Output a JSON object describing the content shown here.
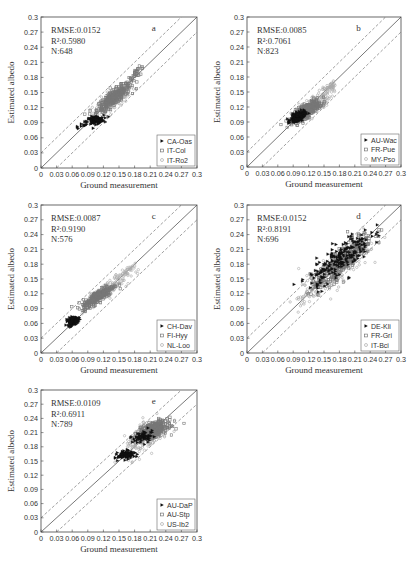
{
  "chart_data": [
    {
      "type": "scatter",
      "panel": "a",
      "xlabel": "Ground measurement",
      "ylabel": "Estimated albedo",
      "xlim": [
        0,
        0.3
      ],
      "ylim": [
        0,
        0.3
      ],
      "xticks": [
        "0",
        "0.03",
        "0.06",
        "0.09",
        "0.12",
        "0.15",
        "0.18",
        "0.21",
        "0.24",
        "0.27",
        "0.3"
      ],
      "yticks": [
        "0",
        "0.03",
        "0.06",
        "0.09",
        "0.12",
        "0.15",
        "0.18",
        "0.21",
        "0.24",
        "0.27",
        "0.3"
      ],
      "stats": {
        "rmse": "RMSE:0.0152",
        "r2": "R²:0.5980",
        "n": "N:648"
      },
      "reference_lines": {
        "one_to_one": true,
        "offset": 0.03
      },
      "legend": [
        "CA-Oas",
        "IT-Col",
        "IT-Ro2"
      ],
      "series": [
        {
          "name": "CA-Oas",
          "marker": "triangle",
          "color": "#111111",
          "clusters": [
            {
              "cx": 0.105,
              "cy": 0.095,
              "sx": 0.008,
              "sy": 0.004,
              "n": 110,
              "rho": 0.3
            },
            {
              "cx": 0.08,
              "cy": 0.085,
              "sx": 0.01,
              "sy": 0.006,
              "n": 12,
              "rho": 0.8
            }
          ]
        },
        {
          "name": "IT-Col",
          "marker": "square",
          "color": "#777777",
          "clusters": [
            {
              "cx": 0.14,
              "cy": 0.14,
              "sx": 0.016,
              "sy": 0.014,
              "n": 330,
              "rho": 0.85
            },
            {
              "cx": 0.185,
              "cy": 0.19,
              "sx": 0.007,
              "sy": 0.006,
              "n": 30,
              "rho": 0.7
            }
          ]
        },
        {
          "name": "IT-Ro2",
          "marker": "circle",
          "color": "#aaaaaa",
          "clusters": [
            {
              "cx": 0.14,
              "cy": 0.135,
              "sx": 0.02,
              "sy": 0.016,
              "n": 150,
              "rho": 0.8
            }
          ]
        }
      ]
    },
    {
      "type": "scatter",
      "panel": "b",
      "xlabel": "Ground measurement",
      "ylabel": "Estimated albedo",
      "xlim": [
        0,
        0.3
      ],
      "ylim": [
        0,
        0.3
      ],
      "xticks": [
        "0",
        "0.03",
        "0.06",
        "0.09",
        "0.12",
        "0.15",
        "0.18",
        "0.21",
        "0.24",
        "0.27",
        "0.3"
      ],
      "yticks": [
        "0",
        "0.03",
        "0.06",
        "0.09",
        "0.12",
        "0.15",
        "0.18",
        "0.21",
        "0.24",
        "0.27",
        "0.3"
      ],
      "stats": {
        "rmse": "RMSE:0.0085",
        "r2": "R²:0.7061",
        "n": "N:823"
      },
      "reference_lines": {
        "one_to_one": true,
        "offset": 0.03
      },
      "legend": [
        "AU-Wac",
        "FR-Pue",
        "MY-Pso"
      ],
      "series": [
        {
          "name": "AU-Wac",
          "marker": "triangle",
          "color": "#111111",
          "clusters": [
            {
              "cx": 0.1,
              "cy": 0.1,
              "sx": 0.007,
              "sy": 0.005,
              "n": 180,
              "rho": 0.6
            }
          ]
        },
        {
          "name": "FR-Pue",
          "marker": "square",
          "color": "#777777",
          "clusters": [
            {
              "cx": 0.115,
              "cy": 0.112,
              "sx": 0.013,
              "sy": 0.01,
              "n": 400,
              "rho": 0.75
            }
          ]
        },
        {
          "name": "MY-Pso",
          "marker": "circle",
          "color": "#aaaaaa",
          "clusters": [
            {
              "cx": 0.13,
              "cy": 0.125,
              "sx": 0.017,
              "sy": 0.014,
              "n": 180,
              "rho": 0.75
            },
            {
              "cx": 0.16,
              "cy": 0.16,
              "sx": 0.006,
              "sy": 0.005,
              "n": 40,
              "rho": 0.6
            }
          ]
        }
      ]
    },
    {
      "type": "scatter",
      "panel": "c",
      "xlabel": "Ground measurement",
      "ylabel": "Estimated albedo",
      "xlim": [
        0,
        0.3
      ],
      "ylim": [
        0,
        0.3
      ],
      "xticks": [
        "0",
        "0.03",
        "0.06",
        "0.09",
        "0.12",
        "0.15",
        "0.18",
        "0.21",
        "0.24",
        "0.27",
        "0.3"
      ],
      "yticks": [
        "0",
        "0.03",
        "0.06",
        "0.09",
        "0.12",
        "0.15",
        "0.18",
        "0.21",
        "0.24",
        "0.27",
        "0.3"
      ],
      "stats": {
        "rmse": "RMSE:0.0087",
        "r2": "R²:0.9190",
        "n": "N:576"
      },
      "reference_lines": {
        "one_to_one": true,
        "offset": 0.03
      },
      "legend": [
        "CH-Dav",
        "FI-Hyy",
        "NL-Loo"
      ],
      "series": [
        {
          "name": "CH-Dav",
          "marker": "triangle",
          "color": "#111111",
          "clusters": [
            {
              "cx": 0.062,
              "cy": 0.065,
              "sx": 0.005,
              "sy": 0.004,
              "n": 150,
              "rho": 0.3
            }
          ]
        },
        {
          "name": "FI-Hyy",
          "marker": "square",
          "color": "#777777",
          "clusters": [
            {
              "cx": 0.11,
              "cy": 0.115,
              "sx": 0.015,
              "sy": 0.012,
              "n": 280,
              "rho": 0.85
            }
          ]
        },
        {
          "name": "NL-Loo",
          "marker": "circle",
          "color": "#aaaaaa",
          "clusters": [
            {
              "cx": 0.13,
              "cy": 0.13,
              "sx": 0.02,
              "sy": 0.017,
              "n": 120,
              "rho": 0.85
            },
            {
              "cx": 0.165,
              "cy": 0.165,
              "sx": 0.008,
              "sy": 0.006,
              "n": 25,
              "rho": 0.8
            }
          ]
        }
      ]
    },
    {
      "type": "scatter",
      "panel": "d",
      "xlabel": "Ground measurement",
      "ylabel": "Estimated albedo",
      "xlim": [
        0,
        0.3
      ],
      "ylim": [
        0,
        0.3
      ],
      "xticks": [
        "0",
        "0.03",
        "0.06",
        "0.09",
        "0.12",
        "0.15",
        "0.18",
        "0.21",
        "0.24",
        "0.27",
        "0.3"
      ],
      "yticks": [
        "0",
        "0.03",
        "0.06",
        "0.09",
        "0.12",
        "0.15",
        "0.18",
        "0.21",
        "0.24",
        "0.27",
        "0.3"
      ],
      "stats": {
        "rmse": "RMSE:0.0152",
        "r2": "R²:0.8191",
        "n": "N:696"
      },
      "reference_lines": {
        "one_to_one": true,
        "offset": 0.03
      },
      "legend": [
        "DE-Kli",
        "FR-Gri",
        "IT-Bci"
      ],
      "series": [
        {
          "name": "DE-Kli",
          "marker": "triangle",
          "color": "#111111",
          "clusters": [
            {
              "cx": 0.18,
              "cy": 0.19,
              "sx": 0.03,
              "sy": 0.028,
              "n": 200,
              "rho": 0.8
            }
          ]
        },
        {
          "name": "FR-Gri",
          "marker": "square",
          "color": "#777777",
          "clusters": [
            {
              "cx": 0.185,
              "cy": 0.185,
              "sx": 0.03,
              "sy": 0.03,
              "n": 300,
              "rho": 0.88
            }
          ]
        },
        {
          "name": "IT-Bci",
          "marker": "circle",
          "color": "#aaaaaa",
          "clusters": [
            {
              "cx": 0.17,
              "cy": 0.165,
              "sx": 0.035,
              "sy": 0.032,
              "n": 190,
              "rho": 0.85
            },
            {
              "cx": 0.11,
              "cy": 0.11,
              "sx": 0.006,
              "sy": 0.006,
              "n": 10,
              "rho": 0.5
            }
          ]
        }
      ]
    },
    {
      "type": "scatter",
      "panel": "e",
      "xlabel": "Ground measurement",
      "ylabel": "Estimated albedo",
      "xlim": [
        0,
        0.3
      ],
      "ylim": [
        0,
        0.3
      ],
      "xticks": [
        "0",
        "0.03",
        "0.06",
        "0.09",
        "0.12",
        "0.15",
        "0.18",
        "0.21",
        "0.24",
        "0.27",
        "0.3"
      ],
      "yticks": [
        "0",
        "0.03",
        "0.06",
        "0.09",
        "0.12",
        "0.15",
        "0.18",
        "0.21",
        "0.24",
        "0.27",
        "0.3"
      ],
      "stats": {
        "rmse": "RMSE:0.0109",
        "r2": "R²:0.6911",
        "n": "N:789"
      },
      "reference_lines": {
        "one_to_one": true,
        "offset": 0.03
      },
      "legend": [
        "AU-DaP",
        "AU-Stp",
        "US-Ib2"
      ],
      "series": [
        {
          "name": "AU-DaP",
          "marker": "triangle",
          "color": "#111111",
          "clusters": [
            {
              "cx": 0.165,
              "cy": 0.163,
              "sx": 0.008,
              "sy": 0.004,
              "n": 110,
              "rho": 0.2
            },
            {
              "cx": 0.195,
              "cy": 0.2,
              "sx": 0.01,
              "sy": 0.008,
              "n": 60,
              "rho": 0.5
            }
          ]
        },
        {
          "name": "AU-Stp",
          "marker": "square",
          "color": "#777777",
          "clusters": [
            {
              "cx": 0.215,
              "cy": 0.215,
              "sx": 0.014,
              "sy": 0.009,
              "n": 420,
              "rho": 0.55
            }
          ]
        },
        {
          "name": "US-Ib2",
          "marker": "circle",
          "color": "#aaaaaa",
          "clusters": [
            {
              "cx": 0.205,
              "cy": 0.2,
              "sx": 0.022,
              "sy": 0.02,
              "n": 180,
              "rho": 0.7
            }
          ]
        }
      ]
    }
  ],
  "layout": {
    "panels": [
      {
        "id": "a",
        "left": 41,
        "top": 17,
        "width": 156,
        "height": 151,
        "label_x": 0.88,
        "label_y": 0.97
      },
      {
        "id": "b",
        "left": 247,
        "top": 17,
        "width": 154,
        "height": 150,
        "label_x": 0.71,
        "label_y": 0.26
      },
      {
        "id": "c",
        "left": 41,
        "top": 205,
        "width": 156,
        "height": 148,
        "label_x": 0.71,
        "label_y": 0.28
      },
      {
        "id": "d",
        "left": 247,
        "top": 205,
        "width": 154,
        "height": 148,
        "label_x": 0.7,
        "label_y": 0.27
      },
      {
        "id": "e",
        "left": 41,
        "top": 390,
        "width": 156,
        "height": 142,
        "label_x": 0.7,
        "label_y": 0.27
      }
    ]
  }
}
